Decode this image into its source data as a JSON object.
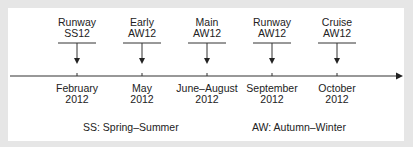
{
  "diagram": {
    "type": "timeline",
    "events": [
      {
        "label_line1": "Runway",
        "label_line2": "SS12",
        "date_line1": "February",
        "date_line2": "2012",
        "x": 77
      },
      {
        "label_line1": "Early",
        "label_line2": "AW12",
        "date_line1": "May",
        "date_line2": "2012",
        "x": 142
      },
      {
        "label_line1": "Main",
        "label_line2": "AW12",
        "date_line1": "June–August",
        "date_line2": "2012",
        "x": 207
      },
      {
        "label_line1": "Runway",
        "label_line2": "AW12",
        "date_line1": "September",
        "date_line2": "2012",
        "x": 272
      },
      {
        "label_line1": "Cruise",
        "label_line2": "AW12",
        "date_line1": "October",
        "date_line2": "2012",
        "x": 337
      }
    ],
    "legend": {
      "ss": "SS: Spring–Summer",
      "aw": "AW: Autumn–Winter"
    },
    "colors": {
      "line": "#333333",
      "text": "#222222",
      "background": "#ffffff",
      "border": "#e6e6e6"
    }
  }
}
